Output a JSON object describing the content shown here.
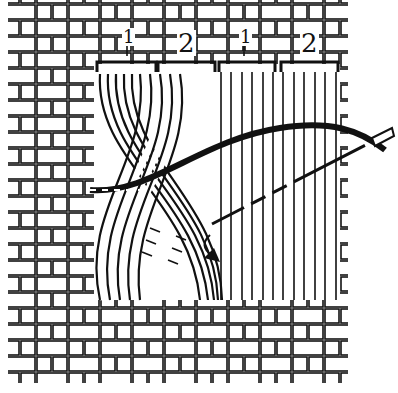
{
  "figure": {
    "labels": [
      {
        "id": "group-1a",
        "text": "1",
        "x": 122,
        "y": 28
      },
      {
        "id": "group-2a",
        "text": "2",
        "x": 178,
        "y": 28
      },
      {
        "id": "group-1b",
        "text": "1",
        "x": 240,
        "y": 28
      },
      {
        "id": "group-2b",
        "text": "2",
        "x": 302,
        "y": 28
      }
    ],
    "colors": {
      "ink": "#111111",
      "paper": "#ffffff"
    }
  }
}
